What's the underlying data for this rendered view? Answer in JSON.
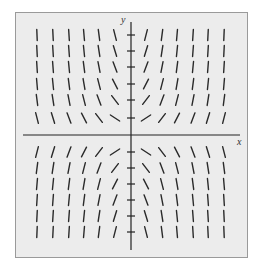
{
  "diagram": {
    "type": "slope-field",
    "axes": {
      "x_label": "x",
      "y_label": "y",
      "origin_px": [
        131,
        135
      ],
      "x_range_px": [
        23,
        240
      ],
      "y_range_px": [
        22,
        250
      ],
      "y_ticks_px": [
        35,
        51,
        67,
        84,
        100,
        118,
        152,
        168,
        184,
        200,
        216,
        232
      ],
      "x_ticks_px": []
    },
    "grid": {
      "columns_px": [
        37,
        53,
        69,
        84,
        99,
        115,
        146,
        162,
        177,
        193,
        208,
        224
      ],
      "rows_px": [
        35,
        51,
        67,
        84,
        100,
        118,
        152,
        168,
        184,
        200,
        216,
        232
      ],
      "column_index": [
        -6,
        -5,
        -4,
        -3,
        -2,
        -1,
        1,
        2,
        3,
        4,
        5,
        6
      ],
      "row_index": [
        6,
        5,
        4,
        3,
        2,
        1,
        -1,
        -2,
        -3,
        -4,
        -5,
        -6
      ],
      "slope_rule": "m = 0.65 * i * j",
      "segment_length_px": 11
    },
    "colors": {
      "background": "#ececec",
      "frame": "#9a9a9a",
      "axis": "#222222",
      "segment": "#2a2a2a"
    }
  }
}
